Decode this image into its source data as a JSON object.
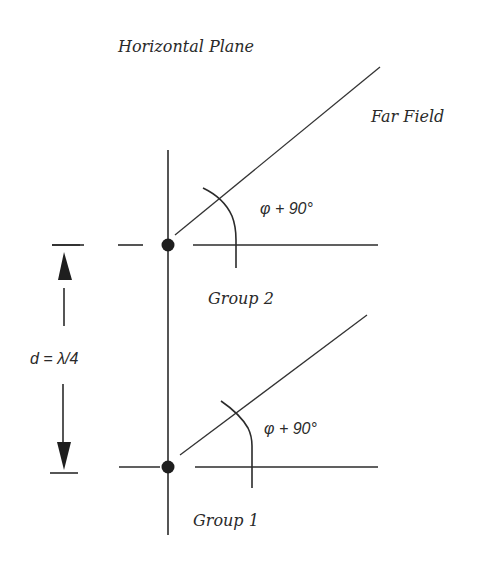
{
  "diagram": {
    "title": "Horizontal Plane",
    "far_field_label": "Far Field",
    "spacing_label": "d = λ/4",
    "groups": [
      {
        "label": "Group 2",
        "angle_label": "φ + 90°"
      },
      {
        "label": "Group 1",
        "angle_label": "φ + 90°"
      }
    ],
    "colors": {
      "line": "#2b2b2b",
      "text": "#2a2a2a",
      "background": "#ffffff"
    }
  }
}
